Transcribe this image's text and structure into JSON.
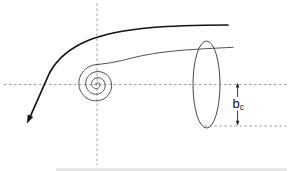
{
  "diagram": {
    "type": "vortex-sheet-rollup-sketch",
    "dimension_label": {
      "base": "b",
      "subscript": "c"
    },
    "colors": {
      "background": "#ffffff",
      "thick_curve": "#141414",
      "thin_curve": "#3c3c3c",
      "axis_dash": "#8f8f8f",
      "ellipse": "#474747",
      "dimension": "#262626",
      "artifact": "#c9c9c9"
    },
    "elements": [
      "vertical-dashed-axis",
      "horizontal-dashed-axis",
      "thick-streamline-with-arrow",
      "thin-sheet-curve-rolling-into-spiral",
      "vertical-ellipse-vortex-core",
      "bc-span-dimension-with-arrows",
      "bottom-dashed-reference-line"
    ]
  }
}
